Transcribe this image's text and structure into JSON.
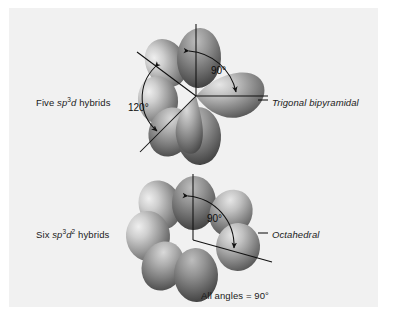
{
  "figure": {
    "background_color": "#f1f1f1",
    "page_color": "#ffffff",
    "ink_color": "#111111"
  },
  "diagrams": [
    {
      "id": "trigonal-bipyramidal",
      "left_label_prefix": "Five ",
      "left_label_sp": "sp",
      "left_label_sp_sup": "3",
      "left_label_d": "d",
      "left_label_suffix": " hybrids",
      "right_label": "Trigonal bipyramidal",
      "angles": [
        "90°",
        "120°"
      ],
      "lobe_count": 5
    },
    {
      "id": "octahedral",
      "left_label_prefix": "Six ",
      "left_label_sp": "sp",
      "left_label_sp_sup": "3",
      "left_label_d": "d",
      "left_label_d_sup": "2",
      "left_label_suffix": " hybrids",
      "right_label": "Octahedral",
      "angles": [
        "90°"
      ],
      "lobe_count": 6,
      "caption": "All angles = 90°"
    }
  ],
  "annotations": {
    "angle_90_top": "90°",
    "angle_120_top": "120°",
    "angle_90_bottom": "90°",
    "caption_bottom": "All angles = 90°"
  }
}
